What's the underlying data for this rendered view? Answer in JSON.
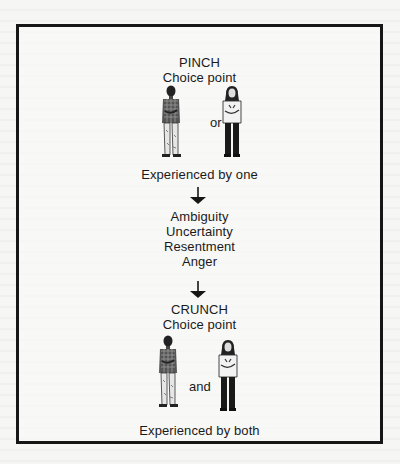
{
  "diagram": {
    "pinch": {
      "title": "PINCH",
      "subtitle": "Choice point",
      "connector": "or",
      "caption": "Experienced by one",
      "figures": [
        "man-figure",
        "woman-figure"
      ]
    },
    "feelings": [
      "Ambiguity",
      "Uncertainty",
      "Resentment",
      "Anger"
    ],
    "crunch": {
      "title": "CRUNCH",
      "subtitle": "Choice point",
      "connector": "and",
      "caption": "Experienced by both",
      "figures": [
        "man-figure",
        "woman-figure"
      ]
    },
    "arrows": [
      "down-arrow",
      "down-arrow"
    ],
    "colors": {
      "ink": "#161616",
      "paper": "#f6f6f4"
    }
  }
}
